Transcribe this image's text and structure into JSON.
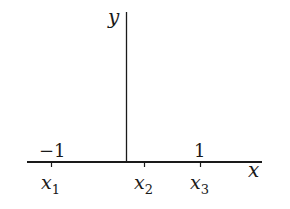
{
  "diagram": {
    "axes": {
      "x_label": "x",
      "y_label": "y",
      "color": "#1a1a1a"
    },
    "ticks": [
      {
        "name": "x1",
        "base": "x",
        "sub": "1",
        "value_label": "−1"
      },
      {
        "name": "x2",
        "base": "x",
        "sub": "2",
        "value_label": ""
      },
      {
        "name": "x3",
        "base": "x",
        "sub": "3",
        "value_label": "1"
      }
    ]
  }
}
